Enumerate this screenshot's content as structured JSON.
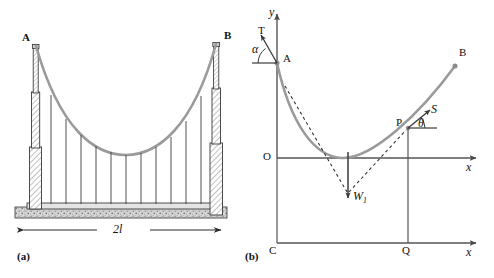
{
  "figure": {
    "title_hidden": "",
    "panels": [
      {
        "caption": "(a)",
        "name": "suspension-bridge-elevation",
        "labels": {
          "left_tower_top": "A",
          "right_tower_top": "B",
          "span_dimension": "2l"
        },
        "hanger_count": 11,
        "colors": {
          "cable": "#9a9a9a",
          "structure_outline": "#3a3a3a",
          "hatch": "#808080",
          "deck": "#b8b8b8"
        }
      },
      {
        "caption": "(b)",
        "name": "cable-free-body-diagram",
        "labels": {
          "y_axis": "y",
          "x_axis_upper": "x",
          "x_axis_lower": "x",
          "origin": "O",
          "point_a": "A",
          "point_b": "B",
          "point_p": "P",
          "point_c": "C",
          "point_q": "Q",
          "tension_at_a": "T",
          "angle_at_a": "α",
          "tension_at_p": "S",
          "angle_at_p": "θ",
          "weight": "W",
          "weight_subscript": "1"
        },
        "colors": {
          "curve": "#9a9a9a",
          "axis": "#555555",
          "vector": "#444444",
          "dashed": "#333333"
        }
      }
    ]
  }
}
